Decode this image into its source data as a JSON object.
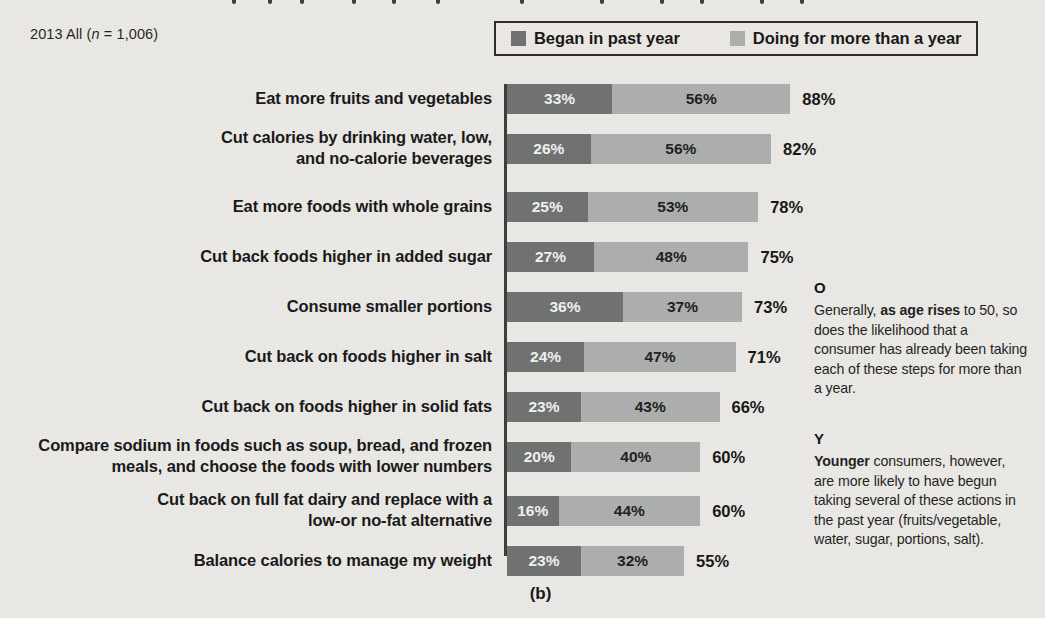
{
  "sample_note": {
    "prefix": "2013 All (",
    "italic_n": "n",
    "suffix": " = 1,006)"
  },
  "legend": {
    "items": [
      {
        "label": "Began in past year",
        "color": "#6f7070",
        "key": "began"
      },
      {
        "label": "Doing for more than a year",
        "color": "#adaeae",
        "key": "longer"
      }
    ]
  },
  "annotations": [
    {
      "marker": "O",
      "lead": "Generally, ",
      "bold": "as age rises",
      "rest": " to 50, so does the likelihood that a consumer has already been taking each of these steps for more than a year."
    },
    {
      "marker": "Y",
      "lead": "",
      "bold": "Younger",
      "rest": " consumers, however, are more likely to have begun taking several of these actions in the past year (fruits/vegetable, water, sugar, portions, salt)."
    }
  ],
  "figure_caption": "(b)",
  "chart_data": {
    "type": "bar",
    "orientation": "horizontal",
    "stacked": true,
    "title": "",
    "subtitle": "2013 All (n = 1,006)",
    "xlabel": "",
    "ylabel": "",
    "xlim": [
      0,
      100
    ],
    "grid": false,
    "legend_position": "top-right",
    "value_suffix": "%",
    "categories": [
      "Eat more fruits and vegetables",
      "Cut calories by drinking water, low, and no-calorie beverages",
      "Eat more foods with whole grains",
      "Cut back foods higher in added sugar",
      "Consume smaller portions",
      "Cut back on foods higher in salt",
      "Cut back on foods higher in solid fats",
      "Compare sodium in foods such as soup, bread, and frozen meals, and choose the foods with lower numbers",
      "Cut back on full fat dairy and replace with a low-or no-fat alternative",
      "Balance calories to manage my weight"
    ],
    "series": [
      {
        "name": "Began in past year",
        "color": "#6f7070",
        "values": [
          33,
          26,
          25,
          27,
          36,
          24,
          23,
          20,
          16,
          23
        ]
      },
      {
        "name": "Doing for more than a year",
        "color": "#adaeae",
        "values": [
          56,
          56,
          53,
          48,
          37,
          47,
          43,
          40,
          44,
          32
        ]
      }
    ],
    "totals": [
      88,
      82,
      78,
      75,
      73,
      71,
      66,
      60,
      60,
      55
    ],
    "rows": [
      {
        "category": "Eat more fruits and vegetables",
        "category_lines": [
          "Eat more fruits and vegetables"
        ],
        "began": 33,
        "began_label": "33%",
        "longer": 56,
        "longer_label": "56%",
        "total": 88,
        "total_label": "88%"
      },
      {
        "category": "Cut calories by drinking water, low, and no-calorie beverages",
        "category_lines": [
          "Cut calories by drinking water, low,",
          "and no-calorie beverages"
        ],
        "began": 26,
        "began_label": "26%",
        "longer": 56,
        "longer_label": "56%",
        "total": 82,
        "total_label": "82%"
      },
      {
        "category": "Eat more foods with whole grains",
        "category_lines": [
          "Eat more foods with whole grains"
        ],
        "began": 25,
        "began_label": "25%",
        "longer": 53,
        "longer_label": "53%",
        "total": 78,
        "total_label": "78%"
      },
      {
        "category": "Cut back foods higher in added sugar",
        "category_lines": [
          "Cut back foods higher in added sugar"
        ],
        "began": 27,
        "began_label": "27%",
        "longer": 48,
        "longer_label": "48%",
        "total": 75,
        "total_label": "75%"
      },
      {
        "category": "Consume smaller portions",
        "category_lines": [
          "Consume smaller portions"
        ],
        "began": 36,
        "began_label": "36%",
        "longer": 37,
        "longer_label": "37%",
        "total": 73,
        "total_label": "73%"
      },
      {
        "category": "Cut back on foods higher in salt",
        "category_lines": [
          "Cut back on foods higher in salt"
        ],
        "began": 24,
        "began_label": "24%",
        "longer": 47,
        "longer_label": "47%",
        "total": 71,
        "total_label": "71%"
      },
      {
        "category": "Cut back on foods higher in solid fats",
        "category_lines": [
          "Cut back on foods higher in solid fats"
        ],
        "began": 23,
        "began_label": "23%",
        "longer": 43,
        "longer_label": "43%",
        "total": 66,
        "total_label": "66%"
      },
      {
        "category": "Compare sodium in foods such as soup, bread, and frozen meals, and choose the foods with lower numbers",
        "category_lines": [
          "Compare sodium in foods such as soup, bread, and frozen",
          "meals, and choose the foods with lower numbers"
        ],
        "began": 20,
        "began_label": "20%",
        "longer": 40,
        "longer_label": "40%",
        "total": 60,
        "total_label": "60%"
      },
      {
        "category": "Cut back on full fat dairy and replace with a low-or no-fat alternative",
        "category_lines": [
          "Cut back on full fat dairy and replace with a",
          "low-or no-fat alternative"
        ],
        "began": 16,
        "began_label": "16%",
        "longer": 44,
        "longer_label": "44%",
        "total": 60,
        "total_label": "60%"
      },
      {
        "category": "Balance calories to manage my weight",
        "category_lines": [
          "Balance calories to manage my weight"
        ],
        "began": 23,
        "began_label": "23%",
        "longer": 32,
        "longer_label": "32%",
        "total": 55,
        "total_label": "55%"
      }
    ]
  }
}
